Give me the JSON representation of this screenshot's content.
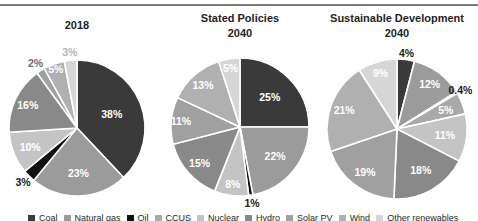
{
  "page": {
    "background": "#ffffff",
    "top_rule_color": "#7a7a7a"
  },
  "chart_data": [
    {
      "type": "pie",
      "title": "2018",
      "title_lines": [
        "2018"
      ],
      "unit": "%",
      "legend_position": "bottom",
      "slices": [
        {
          "category": "Coal",
          "value": 38,
          "label": "38%",
          "label_pos": "inside",
          "lr": 0.55,
          "label_color": "#ffffff"
        },
        {
          "category": "Natural gas",
          "value": 23,
          "label": "23%",
          "label_pos": "inside",
          "lr": 0.66,
          "label_color": "#ffffff"
        },
        {
          "category": "Oil",
          "value": 3,
          "label": "3%",
          "label_pos": "outside",
          "lr": 1.12,
          "label_color": "#1a1a1a"
        },
        {
          "category": "Nuclear",
          "value": 10,
          "label": "10%",
          "label_pos": "inside",
          "lr": 0.74,
          "label_color": "#ffffff"
        },
        {
          "category": "Hydro",
          "value": 16,
          "label": "16%",
          "label_pos": "inside",
          "lr": 0.8,
          "label_color": "#ffffff"
        },
        {
          "category": "Solar PV",
          "value": 2,
          "label": "2%",
          "label_pos": "outside",
          "lr": 1.14,
          "label_color": "#6b6b6b"
        },
        {
          "category": "Wind",
          "value": 5,
          "label": "5%",
          "label_pos": "inside",
          "lr": 0.92,
          "label_color": "#ffffff"
        },
        {
          "category": "Other renewables",
          "value": 3,
          "label": "3%",
          "label_pos": "outside",
          "lr": 1.13,
          "label_color": "#b3b3b3"
        }
      ]
    },
    {
      "type": "pie",
      "title": "Stated Policies 2040",
      "title_lines": [
        "Stated Policies",
        "2040"
      ],
      "unit": "%",
      "legend_position": "bottom",
      "slices": [
        {
          "category": "Coal",
          "value": 25,
          "label": "25%",
          "label_pos": "inside",
          "lr": 0.61,
          "label_color": "#ffffff"
        },
        {
          "category": "Natural gas",
          "value": 22,
          "label": "22%",
          "label_pos": "inside",
          "lr": 0.66,
          "label_color": "#ffffff"
        },
        {
          "category": "Oil",
          "value": 1,
          "label": "1%",
          "label_pos": "outside",
          "lr": 1.12,
          "label_color": "#1a1a1a"
        },
        {
          "category": "Nuclear",
          "value": 8,
          "label": "8%",
          "label_pos": "inside",
          "lr": 0.83,
          "label_color": "#ffffff"
        },
        {
          "category": "Hydro",
          "value": 15,
          "label": "15%",
          "label_pos": "inside",
          "lr": 0.78,
          "label_color": "#ffffff"
        },
        {
          "category": "Solar PV",
          "value": 11,
          "label": "11%",
          "label_pos": "inside",
          "lr": 0.86,
          "label_color": "#ffffff"
        },
        {
          "category": "Wind",
          "value": 13,
          "label": "13%",
          "label_pos": "inside",
          "lr": 0.81,
          "label_color": "#ffffff"
        },
        {
          "category": "Other renewables",
          "value": 5,
          "label": "5%",
          "label_pos": "inside",
          "lr": 0.87,
          "label_color": "#ffffff"
        }
      ]
    },
    {
      "type": "pie",
      "title": "Sustainable Development 2040",
      "title_lines": [
        "Sustainable Development",
        "2040"
      ],
      "unit": "%",
      "legend_position": "bottom",
      "slices": [
        {
          "category": "Coal",
          "value": 4,
          "label": "4%",
          "label_pos": "outside",
          "lr": 1.09,
          "label_color": "#1a1a1a"
        },
        {
          "category": "Natural gas",
          "value": 12,
          "label": "12%",
          "label_pos": "inside",
          "lr": 0.79,
          "label_color": "#ffffff"
        },
        {
          "category": "Oil",
          "value": 0.4,
          "label": "0.4%",
          "label_pos": "outside",
          "lr": 1.06,
          "label_color": "#1a1a1a"
        },
        {
          "category": "CCUS",
          "value": 5,
          "label": "5%",
          "label_pos": "inside",
          "lr": 0.75,
          "label_color": "#ffffff"
        },
        {
          "category": "Nuclear",
          "value": 11,
          "label": "11%",
          "label_pos": "inside",
          "lr": 0.69,
          "label_color": "#ffffff"
        },
        {
          "category": "Hydro",
          "value": 18,
          "label": "18%",
          "label_pos": "inside",
          "lr": 0.68,
          "label_color": "#ffffff"
        },
        {
          "category": "Solar PV",
          "value": 19,
          "label": "19%",
          "label_pos": "inside",
          "lr": 0.76,
          "label_color": "#ffffff"
        },
        {
          "category": "Wind",
          "value": 21,
          "label": "21%",
          "label_pos": "inside",
          "lr": 0.8,
          "label_color": "#ffffff"
        },
        {
          "category": "Other renewables",
          "value": 9,
          "label": "9%",
          "label_pos": "inside",
          "lr": 0.84,
          "label_color": "#ffffff"
        }
      ]
    }
  ],
  "legend": {
    "position": "bottom",
    "items": [
      {
        "label": "Coal",
        "color": "#3a3a3a"
      },
      {
        "label": "Natural gas",
        "color": "#9b9b9b"
      },
      {
        "label": "Oil",
        "color": "#111111"
      },
      {
        "label": "CCUS",
        "color": "#a9a9a9"
      },
      {
        "label": "Nuclear",
        "color": "#c4c4c4"
      },
      {
        "label": "Hydro",
        "color": "#898989"
      },
      {
        "label": "Solar PV",
        "color": "#a0a0a0"
      },
      {
        "label": "Wind",
        "color": "#b0b0b0"
      },
      {
        "label": "Other renewables",
        "color": "#d6d6d6"
      }
    ]
  }
}
